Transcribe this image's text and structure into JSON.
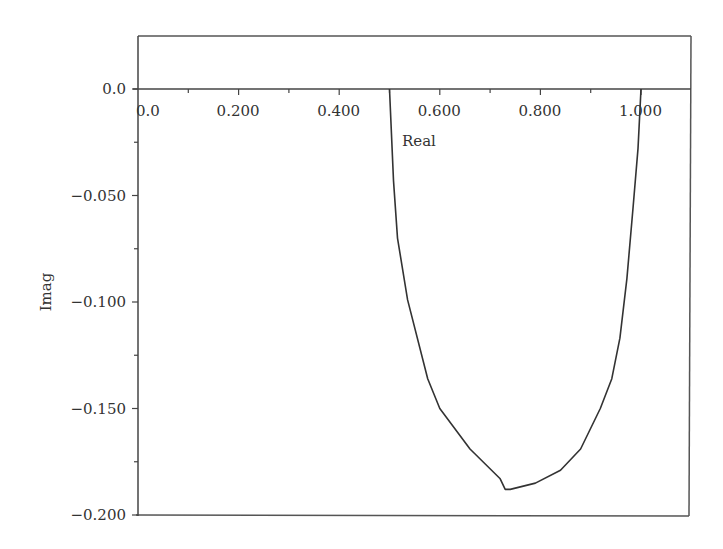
{
  "chart_data": {
    "type": "line",
    "title": "",
    "xlabel": "Real",
    "ylabel": "Imag",
    "xlim": [
      0.0,
      1.1
    ],
    "ylim": [
      -0.2,
      0.025
    ],
    "grid": false,
    "legend": null,
    "x_ticks": [
      "0.0",
      "0.200",
      "0.400",
      "0.600",
      "0.800",
      "1.000"
    ],
    "y_ticks": [
      "0.0",
      "−0.050",
      "−0.100",
      "−0.150",
      "−0.200"
    ],
    "series": [
      {
        "name": "Nyquist locus",
        "color": "#333333",
        "x": [
          0.5,
          0.508,
          0.516,
          0.536,
          0.576,
          0.6,
          0.66,
          0.72,
          0.73,
          0.74,
          0.79,
          0.84,
          0.88,
          0.919,
          0.942,
          0.958,
          0.972,
          0.984,
          0.994,
          1.0
        ],
        "y": [
          0.0,
          -0.043,
          -0.07,
          -0.099,
          -0.136,
          -0.15,
          -0.169,
          -0.183,
          -0.188,
          -0.188,
          -0.185,
          -0.179,
          -0.169,
          -0.15,
          -0.136,
          -0.117,
          -0.089,
          -0.056,
          -0.028,
          0.0
        ]
      }
    ]
  }
}
